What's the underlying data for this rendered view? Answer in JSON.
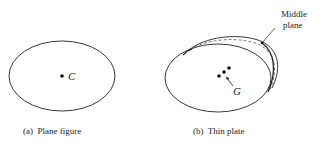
{
  "figure_a": {
    "center_label": "C",
    "caption": "(a)  Plane figure"
  },
  "figure_b": {
    "centroid_label": "G",
    "annotation_line1": "Middle",
    "annotation_line2": "plane",
    "caption": "(b)  Thin plate"
  },
  "colors": {
    "stroke": "#222222",
    "background": "#ffffff"
  }
}
